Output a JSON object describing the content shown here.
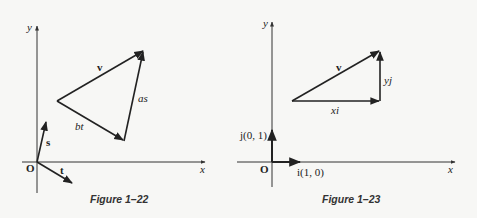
{
  "figures": [
    {
      "caption": "Figure 1–22",
      "axes": {
        "x_label": "x",
        "y_label": "y",
        "origin_label": "O"
      },
      "vectors": {
        "v": "v",
        "as": "as",
        "bt": "bt",
        "s": "s",
        "t": "t"
      }
    },
    {
      "caption": "Figure 1–23",
      "axes": {
        "x_label": "x",
        "y_label": "y",
        "origin_label": "O"
      },
      "vectors": {
        "v": "v",
        "xi": "xi",
        "yj": "yj",
        "i": "i(1, 0)",
        "j": "j(0, 1)"
      }
    }
  ],
  "colors": {
    "ink": "#222222",
    "background": "#f7f7f5"
  }
}
